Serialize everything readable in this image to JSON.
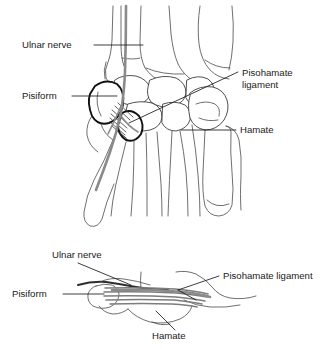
{
  "figure": {
    "background_color": "#ffffff",
    "line_color": "#3c3c3c",
    "nerve_color": "#8a8a8a",
    "text_color": "#1a1a1a"
  },
  "upper_panel": {
    "name": "palmar-view-wrist",
    "view": "palmar (volar) view of wrist and hand skeleton",
    "labels": [
      {
        "id": "ulnar-nerve",
        "text": "Ulnar nerve",
        "text_x": 22,
        "text_y": 48,
        "anchor": "start",
        "leader": "M 94 45 L 143 45"
      },
      {
        "id": "pisiform",
        "text": "Pisiform",
        "text_x": 22,
        "text_y": 99,
        "anchor": "start",
        "leader": "M 72 96 L 117 96"
      },
      {
        "id": "pisohamate-ligament",
        "text": "Pisohamate",
        "text_line2": "ligament",
        "text_x": 242,
        "text_y": 76,
        "text_y2": 88,
        "anchor": "start",
        "leader": "M 238 72 L 129 123"
      },
      {
        "id": "hamate",
        "text": "Hamate",
        "text_x": 240,
        "text_y": 133,
        "anchor": "start",
        "leader": "M 236 130 L 181 130"
      }
    ]
  },
  "lower_panel": {
    "name": "lateral-view-wrist",
    "view": "lateral cross-section view of pisohamate ligament",
    "labels": [
      {
        "id": "ulnar-nerve",
        "text": "Ulnar nerve",
        "text_x": 52,
        "text_y": 258,
        "anchor": "start",
        "leader": "M 78 263 L 131 285"
      },
      {
        "id": "pisohamate-ligament",
        "text": "Pisohamate ligament",
        "text_x": 223,
        "text_y": 279,
        "anchor": "start",
        "leader": "M 219 276 L 178 290"
      },
      {
        "id": "pisiform",
        "text": "Pisiform",
        "text_x": 12,
        "text_y": 297,
        "anchor": "start",
        "leader": "M 63 294 L 104 294"
      },
      {
        "id": "hamate",
        "text": "Hamate",
        "text_x": 152,
        "text_y": 339,
        "anchor": "start",
        "leader": "M 175 330 L 156 311"
      }
    ]
  }
}
